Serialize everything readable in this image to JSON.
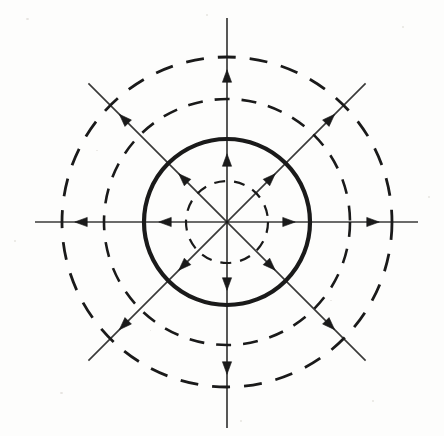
{
  "figure": {
    "name": "phase-portrait-unstable-limit-cycle",
    "width": 444,
    "height": 436,
    "background_color": "#fdfdfc",
    "stroke_color": "#1a1a1a",
    "center": {
      "x": 227,
      "y": 222
    }
  },
  "chart_data": {
    "type": "scatter",
    "subtitle": "",
    "xlabel": "",
    "ylabel": "",
    "xlim": [
      -192,
      191
    ],
    "ylim": [
      -206,
      204
    ],
    "grid": false,
    "legend_position": "none",
    "annotations": [],
    "coordinate_system": "polar",
    "circles": [
      {
        "name": "inner-dashed-orbit",
        "radius": 41,
        "style": "dashed",
        "stroke_width": 2.2,
        "dash_pattern": "11 9",
        "role": "inner trajectory circle"
      },
      {
        "name": "limit-cycle",
        "radius": 83,
        "style": "solid",
        "stroke_width": 4.2,
        "dash_pattern": "none",
        "role": "unstable limit cycle"
      },
      {
        "name": "middle-dashed-orbit",
        "radius": 123,
        "style": "dashed",
        "stroke_width": 2.6,
        "dash_pattern": "15 12",
        "role": "outer trajectory circle"
      },
      {
        "name": "outer-dashed-orbit",
        "radius": 165,
        "style": "dashed",
        "stroke_width": 2.8,
        "dash_pattern": "18 14",
        "role": "outermost trajectory circle"
      }
    ],
    "rays": [
      {
        "name": "ray-east",
        "angle_deg": 0,
        "length_out": 191,
        "length_in": 192
      },
      {
        "name": "ray-northeast",
        "angle_deg": 45,
        "length_out": 196,
        "length_in": 196
      },
      {
        "name": "ray-north",
        "angle_deg": 90,
        "length_out": 204,
        "length_in": 206
      },
      {
        "name": "ray-northwest",
        "angle_deg": 135,
        "length_out": 196,
        "length_in": 196
      }
    ],
    "arrows": [
      {
        "name": "arrow-east-inner",
        "angle_deg": 0,
        "radius": 62,
        "direction": "outward"
      },
      {
        "name": "arrow-east-outer",
        "angle_deg": 0,
        "radius": 146,
        "direction": "outward"
      },
      {
        "name": "arrow-west-inner",
        "angle_deg": 180,
        "radius": 62,
        "direction": "outward"
      },
      {
        "name": "arrow-west-outer",
        "angle_deg": 180,
        "radius": 146,
        "direction": "outward"
      },
      {
        "name": "arrow-north-inner",
        "angle_deg": 90,
        "radius": 62,
        "direction": "outward"
      },
      {
        "name": "arrow-north-outer",
        "angle_deg": 90,
        "radius": 146,
        "direction": "outward"
      },
      {
        "name": "arrow-south-inner",
        "angle_deg": 270,
        "radius": 62,
        "direction": "outward"
      },
      {
        "name": "arrow-south-outer",
        "angle_deg": 270,
        "radius": 146,
        "direction": "outward"
      },
      {
        "name": "arrow-northeast-inner",
        "angle_deg": 45,
        "radius": 62,
        "direction": "outward"
      },
      {
        "name": "arrow-northeast-outer",
        "angle_deg": 45,
        "radius": 146,
        "direction": "outward"
      },
      {
        "name": "arrow-northwest-inner",
        "angle_deg": 135,
        "radius": 62,
        "direction": "outward"
      },
      {
        "name": "arrow-northwest-outer",
        "angle_deg": 135,
        "radius": 146,
        "direction": "outward"
      },
      {
        "name": "arrow-southwest-inner",
        "angle_deg": 225,
        "radius": 62,
        "direction": "outward"
      },
      {
        "name": "arrow-southwest-outer",
        "angle_deg": 225,
        "radius": 146,
        "direction": "outward"
      },
      {
        "name": "arrow-southeast-inner",
        "angle_deg": 315,
        "radius": 62,
        "direction": "outward"
      },
      {
        "name": "arrow-southeast-outer",
        "angle_deg": 315,
        "radius": 146,
        "direction": "outward"
      }
    ]
  }
}
